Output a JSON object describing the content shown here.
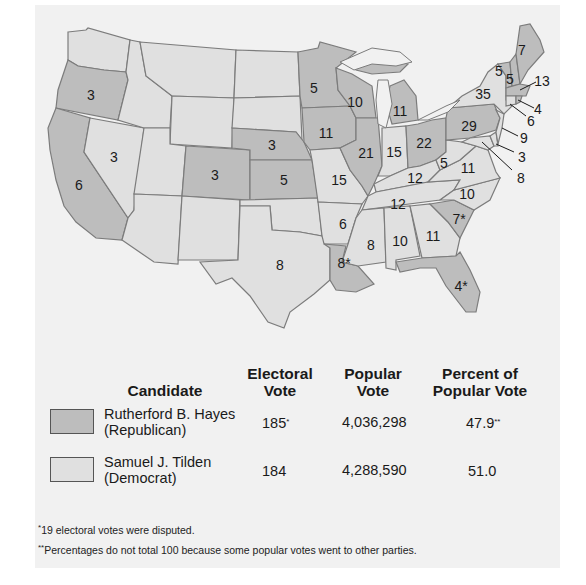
{
  "map": {
    "title": "Election of 1876",
    "colors": {
      "republican": "#bdbdbd",
      "democrat": "#e0e0e0",
      "border": "#7c7c7c"
    },
    "states": [
      {
        "name": "Oregon",
        "votes": "3",
        "party": "republican"
      },
      {
        "name": "California",
        "votes": "6",
        "party": "republican"
      },
      {
        "name": "Nevada",
        "votes": "3",
        "party": "republican"
      },
      {
        "name": "Colorado",
        "votes": "3",
        "party": "republican"
      },
      {
        "name": "Nebraska",
        "votes": "3",
        "party": "republican"
      },
      {
        "name": "Kansas",
        "votes": "5",
        "party": "republican"
      },
      {
        "name": "Texas",
        "votes": "8",
        "party": "democrat"
      },
      {
        "name": "Minnesota",
        "votes": "5",
        "party": "republican"
      },
      {
        "name": "Iowa",
        "votes": "11",
        "party": "republican"
      },
      {
        "name": "Missouri",
        "votes": "15",
        "party": "democrat"
      },
      {
        "name": "Arkansas",
        "votes": "6",
        "party": "democrat"
      },
      {
        "name": "Louisiana",
        "votes": "8*",
        "party": "republican"
      },
      {
        "name": "Wisconsin",
        "votes": "10",
        "party": "republican"
      },
      {
        "name": "Illinois",
        "votes": "21",
        "party": "republican"
      },
      {
        "name": "Michigan",
        "votes": "11",
        "party": "republican"
      },
      {
        "name": "Indiana",
        "votes": "15",
        "party": "democrat"
      },
      {
        "name": "Ohio",
        "votes": "22",
        "party": "republican"
      },
      {
        "name": "Kentucky",
        "votes": "12",
        "party": "democrat"
      },
      {
        "name": "Tennessee",
        "votes": "12",
        "party": "democrat"
      },
      {
        "name": "Mississippi",
        "votes": "8",
        "party": "democrat"
      },
      {
        "name": "Alabama",
        "votes": "10",
        "party": "democrat"
      },
      {
        "name": "Georgia",
        "votes": "11",
        "party": "democrat"
      },
      {
        "name": "Florida",
        "votes": "4*",
        "party": "republican"
      },
      {
        "name": "South Carolina",
        "votes": "7*",
        "party": "republican"
      },
      {
        "name": "North Carolina",
        "votes": "10",
        "party": "democrat"
      },
      {
        "name": "Virginia",
        "votes": "11",
        "party": "democrat"
      },
      {
        "name": "West Virginia",
        "votes": "5",
        "party": "democrat"
      },
      {
        "name": "Pennsylvania",
        "votes": "29",
        "party": "republican"
      },
      {
        "name": "New York",
        "votes": "35",
        "party": "democrat"
      },
      {
        "name": "Vermont",
        "votes": "5",
        "party": "republican"
      },
      {
        "name": "New Hampshire",
        "votes": "5",
        "party": "republican"
      },
      {
        "name": "Maine",
        "votes": "7",
        "party": "republican"
      },
      {
        "name": "Massachusetts",
        "votes": "13",
        "party": "republican"
      },
      {
        "name": "Rhode Island",
        "votes": "4",
        "party": "republican"
      },
      {
        "name": "Connecticut",
        "votes": "6",
        "party": "democrat"
      },
      {
        "name": "New Jersey",
        "votes": "9",
        "party": "democrat"
      },
      {
        "name": "Delaware",
        "votes": "3",
        "party": "democrat"
      },
      {
        "name": "Maryland",
        "votes": "8",
        "party": "democrat"
      }
    ],
    "labels": {
      "or": "3",
      "ca": "6",
      "nv": "3",
      "co": "3",
      "ne": "3",
      "ks": "5",
      "tx": "8",
      "mn": "5",
      "ia": "11",
      "mo": "15",
      "ar": "6",
      "la": "8*",
      "wi": "10",
      "il": "21",
      "mi": "11",
      "in": "15",
      "oh": "22",
      "ky": "12",
      "tn": "12",
      "ms": "8",
      "al": "10",
      "ga": "11",
      "fl": "4*",
      "sc": "7*",
      "nc": "10",
      "va": "11",
      "wv": "5",
      "pa": "29",
      "ny": "35",
      "vt": "5",
      "nh": "5",
      "me": "7",
      "ma": "13",
      "ri": "4",
      "ct": "6",
      "nj": "9",
      "de": "3",
      "md": "8"
    }
  },
  "table": {
    "headers": {
      "candidate": "Candidate",
      "electoral_1": "Electoral",
      "electoral_2": "Vote",
      "popular_1": "Popular",
      "popular_2": "Vote",
      "percent_1": "Percent of",
      "percent_2": "Popular Vote"
    },
    "rows": [
      {
        "name": "Rutherford B. Hayes",
        "party": "(Republican)",
        "electoral": "185",
        "electoral_mark": "*",
        "popular": "4,036,298",
        "percent": "47.9",
        "percent_mark": "**",
        "swatch_color": "#bdbdbd"
      },
      {
        "name": "Samuel J. Tilden",
        "party": "(Democrat)",
        "electoral": "184",
        "electoral_mark": "",
        "popular": "4,288,590",
        "percent": "51.0",
        "percent_mark": "",
        "swatch_color": "#e0e0e0"
      }
    ]
  },
  "footnotes": [
    {
      "mark": "*",
      "text": "19 electoral votes were disputed."
    },
    {
      "mark": "**",
      "text": "Percentages do not total 100 because some popular votes went to other parties."
    }
  ]
}
